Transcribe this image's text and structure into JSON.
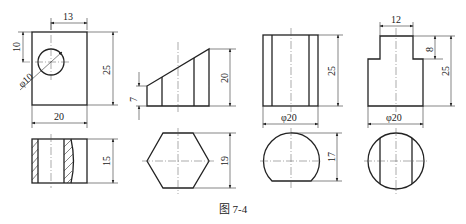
{
  "figure": {
    "caption": "图 7-4",
    "views": [
      {
        "id": "view-1",
        "front_dims": {
          "width": "20",
          "height": "25",
          "hole_offset_x": "13",
          "hole_offset_y": "10",
          "hole_diameter": "φ10"
        },
        "bottom_dims": {
          "height": "15"
        }
      },
      {
        "id": "view-2",
        "front_dims": {
          "left_height": "7",
          "right_height": "20"
        },
        "bottom_dims": {
          "height": "19"
        }
      },
      {
        "id": "view-3",
        "front_dims": {
          "diameter": "φ20",
          "height": "25"
        },
        "bottom_dims": {
          "height": "17"
        }
      },
      {
        "id": "view-4",
        "front_dims": {
          "top_width": "12",
          "step_height": "8",
          "height": "25",
          "diameter": "φ20"
        }
      }
    ]
  }
}
